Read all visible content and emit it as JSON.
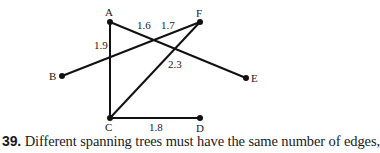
{
  "figure": {
    "nodes": [
      {
        "id": "A",
        "label": "A",
        "x": 110,
        "y": 22,
        "lx": 105,
        "ly": 16
      },
      {
        "id": "F",
        "label": "F",
        "x": 200,
        "y": 22,
        "lx": 196,
        "ly": 17
      },
      {
        "id": "B",
        "label": "B",
        "x": 62,
        "y": 76,
        "lx": 49,
        "ly": 80
      },
      {
        "id": "E",
        "label": "E",
        "x": 246,
        "y": 78,
        "lx": 251,
        "ly": 82
      },
      {
        "id": "C",
        "label": "C",
        "x": 110,
        "y": 118,
        "lx": 105,
        "ly": 131
      },
      {
        "id": "D",
        "label": "D",
        "x": 200,
        "y": 118,
        "lx": 196,
        "ly": 132
      }
    ],
    "edges": [
      {
        "from": "A",
        "to": "C",
        "weight": "1.9",
        "lx": 94,
        "ly": 49
      },
      {
        "from": "A",
        "to": "E",
        "weight": "1.6",
        "lx": 137,
        "ly": 29
      },
      {
        "from": "B",
        "to": "F",
        "weight": "1.7",
        "lx": 161,
        "ly": 29
      },
      {
        "from": "C",
        "to": "F",
        "weight": "2.3",
        "lx": 168,
        "ly": 68
      },
      {
        "from": "C",
        "to": "D",
        "weight": "1.8",
        "lx": 149,
        "ly": 131
      }
    ]
  },
  "caption": {
    "number": "39.",
    "text": "Different spanning trees must have the same number of edges,"
  }
}
